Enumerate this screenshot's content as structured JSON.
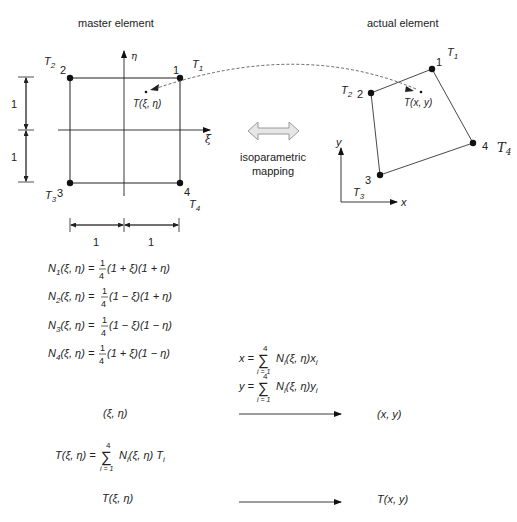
{
  "titles": {
    "master": "master element",
    "actual": "actual element",
    "mapping_line1": "isoparametric",
    "mapping_line2": "mapping"
  },
  "master_element": {
    "nodes": [
      {
        "id": "1",
        "temp": "T",
        "temp_sub": "1"
      },
      {
        "id": "2",
        "temp": "T",
        "temp_sub": "2"
      },
      {
        "id": "3",
        "temp": "T",
        "temp_sub": "3"
      },
      {
        "id": "4",
        "temp": "T",
        "temp_sub": "4"
      }
    ],
    "axis_h": "ξ",
    "axis_v": "η",
    "point_label": "T(ξ, η)",
    "dim_v": [
      "1",
      "1"
    ],
    "dim_h": [
      "1",
      "1"
    ]
  },
  "actual_element": {
    "nodes": [
      {
        "id": "1",
        "temp": "T",
        "temp_sub": "1"
      },
      {
        "id": "2",
        "temp": "T",
        "temp_sub": "2"
      },
      {
        "id": "3",
        "temp": "T",
        "temp_sub": "3"
      },
      {
        "id": "4",
        "temp": "T",
        "temp_sub": "4"
      }
    ],
    "axis_x": "x",
    "axis_y": "y",
    "point_label": "T(x, y)"
  },
  "shape_functions": [
    {
      "lhs": "N",
      "sub": "1",
      "args": "(ξ, η) =",
      "frac_num": "1",
      "frac_den": "4",
      "rhs": "(1 + ξ)(1 + η)"
    },
    {
      "lhs": "N",
      "sub": "2",
      "args": "(ξ, η) =",
      "frac_num": "1",
      "frac_den": "4",
      "rhs": "(1 − ξ)(1 + η)"
    },
    {
      "lhs": "N",
      "sub": "3",
      "args": "(ξ, η) =",
      "frac_num": "1",
      "frac_den": "4",
      "rhs": "(1 − ξ)(1 − η)"
    },
    {
      "lhs": "N",
      "sub": "4",
      "args": "(ξ, η) =",
      "frac_num": "1",
      "frac_den": "4",
      "rhs": "(1 + ξ)(1 − η)"
    }
  ],
  "coord_map": {
    "x_lhs": "x =",
    "y_lhs": "y =",
    "sum_top": "4",
    "sum_bottom": "i = 1",
    "sum_symbol": "∑",
    "x_body": "N",
    "x_body_sub": "i",
    "x_body_args": "(ξ, η)x",
    "y_body_args": "(ξ, η)y",
    "var_sub": "i",
    "from": "(ξ, η)",
    "to": "(x, y)"
  },
  "temp_map": {
    "lhs": "T(ξ, η) =",
    "sum_top": "4",
    "sum_bottom": "i = 1",
    "sum_symbol": "∑",
    "body": "N",
    "body_sub": "i",
    "body_args": "(ξ, η) T",
    "body_tsub": "i",
    "from": "T(ξ, η)",
    "to": "T(x, y)"
  }
}
